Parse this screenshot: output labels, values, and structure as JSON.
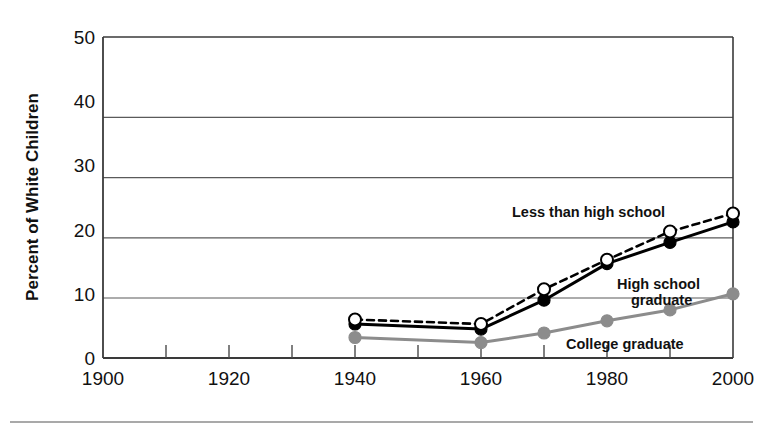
{
  "chart_data": {
    "type": "line",
    "title": "",
    "subtitle": "",
    "xlabel": "",
    "ylabel": "Percent of White Children",
    "x": [
      1940,
      1960,
      1970,
      1980,
      1990,
      2000
    ],
    "xlim": [
      1900,
      2000
    ],
    "ylim": [
      0,
      50
    ],
    "x_tick_labels": [
      "1900",
      "1920",
      "1940",
      "1960",
      "1980",
      "2000"
    ],
    "x_tick_values": [
      1900,
      1920,
      1940,
      1960,
      1980,
      2000
    ],
    "x_minor_ticks": [
      1910,
      1930,
      1950,
      1970,
      1990
    ],
    "y_tick_labels": [
      "0",
      "10",
      "20",
      "30",
      "40",
      "50"
    ],
    "y_tick_values": [
      0,
      10,
      20,
      30,
      40,
      50
    ],
    "grid": "horizontal",
    "legend_position": "inline-annotations",
    "series": [
      {
        "name": "Less than high school",
        "label": "Less than high school",
        "color": "#000000",
        "marker": "open-circle",
        "linestyle": "dashed",
        "values": [
          6.0,
          5.3,
          10.7,
          15.3,
          19.7,
          22.5
        ]
      },
      {
        "name": "High school graduate",
        "label_line1": "High school",
        "label_line2": "graduate",
        "color": "#000000",
        "marker": "filled-circle",
        "linestyle": "solid",
        "values": [
          5.3,
          4.5,
          9.0,
          14.7,
          18.0,
          21.2
        ]
      },
      {
        "name": "College graduate",
        "label": "College graduate",
        "color": "#8c8c8c",
        "marker": "filled-circle",
        "linestyle": "solid",
        "values": [
          3.2,
          2.4,
          3.9,
          5.8,
          7.5,
          10.0
        ]
      }
    ],
    "annotations": [
      {
        "text": "Less than high school",
        "x": 1970,
        "y": 24
      },
      {
        "text": "High school",
        "x": 1981,
        "y": 13.2
      },
      {
        "text": "graduate",
        "x": 1984,
        "y": 11.2
      },
      {
        "text": "College graduate",
        "x": 1978,
        "y": 2.6
      }
    ]
  },
  "axis": {
    "y_title": "Percent of White Children"
  }
}
